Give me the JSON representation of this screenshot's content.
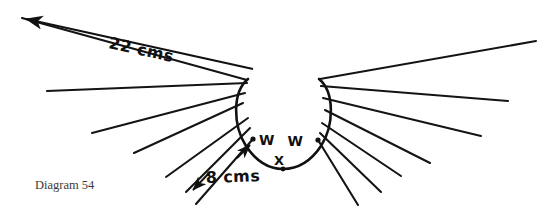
{
  "figure": {
    "caption": "Diagram 54",
    "background_color": "#ffffff",
    "ink_color": "#111111"
  },
  "labels": {
    "w_left": "W",
    "w_right": "W",
    "x_bottom": "X",
    "dim_top": "22 cms",
    "dim_lower": "8 cms"
  },
  "chart_data": {
    "type": "diagram",
    "title": "Diagram 54",
    "annotations": [
      {
        "text": "22 cms",
        "kind": "dimension",
        "value": 22,
        "unit": "cms"
      },
      {
        "text": "8 cms",
        "kind": "dimension",
        "value": 8,
        "unit": "cms"
      },
      {
        "text": "W",
        "kind": "point-label"
      },
      {
        "text": "W",
        "kind": "point-label"
      },
      {
        "text": "X",
        "kind": "point-label"
      }
    ],
    "points": [
      {
        "name": "W-left",
        "x": 253,
        "y": 139
      },
      {
        "name": "W-right",
        "x": 318,
        "y": 140
      },
      {
        "name": "X",
        "x": 283,
        "y": 169
      }
    ],
    "bulb": {
      "cx": 283,
      "cy": 122,
      "rx": 47,
      "ry": 50
    },
    "rays_left": [
      {
        "x1": 247,
        "y1": 80,
        "x2": 22,
        "y2": 18
      },
      {
        "x1": 247,
        "y1": 83,
        "x2": 47,
        "y2": 91
      },
      {
        "x1": 245,
        "y1": 93,
        "x2": 92,
        "y2": 133
      },
      {
        "x1": 243,
        "y1": 103,
        "x2": 134,
        "y2": 153
      },
      {
        "x1": 248,
        "y1": 118,
        "x2": 166,
        "y2": 177
      },
      {
        "x1": 250,
        "y1": 128,
        "x2": 186,
        "y2": 192
      },
      {
        "x1": 253,
        "y1": 139,
        "x2": 196,
        "y2": 204
      }
    ],
    "rays_right": [
      {
        "x1": 320,
        "y1": 79,
        "x2": 536,
        "y2": 41
      },
      {
        "x1": 321,
        "y1": 86,
        "x2": 508,
        "y2": 101
      },
      {
        "x1": 323,
        "y1": 98,
        "x2": 481,
        "y2": 136
      },
      {
        "x1": 325,
        "y1": 110,
        "x2": 430,
        "y2": 163
      },
      {
        "x1": 322,
        "y1": 123,
        "x2": 401,
        "y2": 176
      },
      {
        "x1": 320,
        "y1": 133,
        "x2": 381,
        "y2": 192
      },
      {
        "x1": 318,
        "y1": 140,
        "x2": 358,
        "y2": 205
      }
    ],
    "dimension_22": {
      "from_x": 22,
      "from_y": 18,
      "to_x": 253,
      "to_y": 69,
      "both_ends": true
    },
    "dimension_8": {
      "from_x": 249,
      "from_y": 146,
      "to_x": 193,
      "to_y": 200,
      "both_ends": true
    }
  }
}
